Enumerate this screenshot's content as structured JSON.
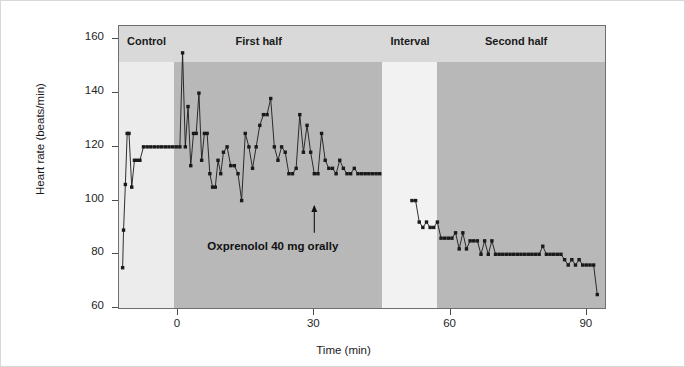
{
  "figure": {
    "background": "#ffffff",
    "plot_background": "#e9e9e9"
  },
  "chart_data": {
    "type": "line",
    "title": "",
    "xlabel": "Time (min)",
    "ylabel": "Heart rate (beats/min)",
    "xlim": [
      -13,
      94
    ],
    "ylim": [
      60,
      165
    ],
    "yticks": [
      60,
      80,
      100,
      120,
      140,
      160
    ],
    "xticks": [
      0,
      30,
      60,
      90
    ],
    "grid": false,
    "legend": "none",
    "marker": "filled-square",
    "line_color": "#1a1a1a",
    "annotations": [
      {
        "text": "Oxprenolol 40 mg orally",
        "x": 30,
        "y": 82,
        "arrow_to_y": 98,
        "arrow_from_y": 88
      }
    ],
    "phases": [
      {
        "name": "Control",
        "x_start": -13,
        "x_end": -1,
        "shade": "#ececec"
      },
      {
        "name": "First half",
        "x_start": -1,
        "x_end": 45,
        "shade": "#b8b8b8"
      },
      {
        "name": "Interval",
        "x_start": 45,
        "x_end": 57,
        "shade": "#f2f2f2"
      },
      {
        "name": "Second half",
        "x_start": 57,
        "x_end": 94,
        "shade": "#b8b8b8"
      }
    ],
    "header_band_color": "#d9d9d9",
    "series": [
      {
        "name": "Heart rate",
        "x": [
          -12.2,
          -12.0,
          -11.6,
          -11.2,
          -10.8,
          -10.2,
          -9.6,
          -9.0,
          -8.4,
          -7.6,
          -6.8,
          -6.0,
          -5.2,
          -4.4,
          -3.6,
          -2.8,
          -2.0,
          -1.2,
          -0.4,
          0.4,
          1.0,
          1.6,
          2.2,
          2.8,
          3.4,
          4.0,
          4.6,
          5.2,
          5.8,
          6.4,
          7.0,
          7.6,
          8.2,
          8.8,
          9.4,
          10.0,
          10.8,
          11.6,
          12.4,
          13.2,
          14.0,
          14.8,
          15.6,
          16.4,
          17.2,
          18.0,
          18.8,
          19.6,
          20.4,
          21.2,
          22.0,
          22.8,
          23.6,
          24.4,
          25.2,
          26.0,
          26.8,
          27.6,
          28.4,
          29.2,
          30.0,
          30.8,
          31.6,
          32.4,
          33.2,
          34.0,
          34.8,
          35.6,
          36.4,
          37.2,
          38.0,
          38.8,
          39.6,
          40.4,
          41.2,
          42.0,
          42.8,
          43.6,
          44.4,
          51.5,
          52.3,
          53.1,
          53.9,
          54.7,
          55.5,
          56.3,
          57.1,
          57.9,
          58.7,
          59.5,
          60.3,
          61.1,
          61.9,
          62.7,
          63.5,
          64.3,
          65.1,
          65.9,
          66.7,
          67.5,
          68.3,
          69.1,
          69.9,
          70.7,
          71.5,
          72.3,
          73.1,
          73.9,
          74.7,
          75.5,
          76.3,
          77.1,
          77.9,
          78.7,
          79.5,
          80.3,
          81.1,
          81.9,
          82.7,
          83.5,
          84.3,
          85.1,
          85.9,
          86.7,
          87.5,
          88.3,
          89.1,
          89.9,
          90.7,
          91.5,
          92.3
        ],
        "y": [
          75,
          89,
          106,
          125,
          125,
          105,
          115,
          115,
          115,
          120,
          120,
          120,
          120,
          120,
          120,
          120,
          120,
          120,
          120,
          120,
          155,
          120,
          135,
          113,
          125,
          125,
          140,
          115,
          125,
          125,
          110,
          105,
          105,
          115,
          110,
          118,
          120,
          113,
          113,
          110,
          100,
          125,
          120,
          112,
          120,
          128,
          132,
          132,
          138,
          120,
          115,
          120,
          118,
          110,
          110,
          112,
          132,
          118,
          128,
          118,
          110,
          110,
          125,
          115,
          112,
          112,
          110,
          115,
          112,
          110,
          110,
          112,
          110,
          110,
          110,
          110,
          110,
          110,
          110,
          100,
          100,
          92,
          90,
          92,
          90,
          90,
          92,
          86,
          86,
          86,
          86,
          88,
          82,
          88,
          82,
          85,
          85,
          85,
          80,
          85,
          80,
          85,
          80,
          80,
          80,
          80,
          80,
          80,
          80,
          80,
          80,
          80,
          80,
          80,
          80,
          83,
          80,
          80,
          80,
          80,
          80,
          78,
          76,
          78,
          76,
          78,
          76,
          76,
          76,
          76,
          65
        ]
      }
    ]
  }
}
